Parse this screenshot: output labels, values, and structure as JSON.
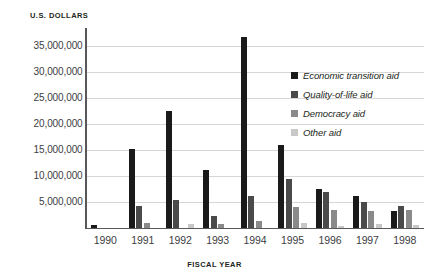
{
  "figure": {
    "title_remnant": "",
    "ylabel": "U.S. DOLLARS",
    "xlabel": "FISCAL YEAR"
  },
  "axis": {
    "yticks": [
      {
        "value": 35000000,
        "label": "35,000,000"
      },
      {
        "value": 30000000,
        "label": "30,000,000"
      },
      {
        "value": 25000000,
        "label": "25,000,000"
      },
      {
        "value": 20000000,
        "label": "20,000,000"
      },
      {
        "value": 15000000,
        "label": "15,000,000"
      },
      {
        "value": 10000000,
        "label": "10,000,000"
      },
      {
        "value": 5000000,
        "label": "5,000,000"
      }
    ]
  },
  "legend": {
    "items": [
      {
        "label": "Economic transition aid",
        "color": "#1a1a1a"
      },
      {
        "label": "Quality-of-life aid",
        "color": "#4a4a4a"
      },
      {
        "label": "Democracy aid",
        "color": "#8a8a8a"
      },
      {
        "label": "Other aid",
        "color": "#c8c8c8"
      }
    ]
  },
  "chart_data": {
    "type": "bar",
    "title": "",
    "xlabel": "FISCAL YEAR",
    "ylabel": "U.S. DOLLARS",
    "ylim": [
      0,
      38500000
    ],
    "grid": true,
    "legend_position": "right",
    "categories": [
      "1990",
      "1991",
      "1992",
      "1993",
      "1994",
      "1995",
      "1996",
      "1997",
      "1998"
    ],
    "series": [
      {
        "name": "Economic transition aid",
        "color": "#1a1a1a",
        "values": [
          500000,
          15300000,
          22500000,
          11200000,
          36800000,
          16000000,
          7500000,
          6200000,
          3300000
        ]
      },
      {
        "name": "Quality-of-life aid",
        "color": "#4a4a4a",
        "values": [
          0,
          4200000,
          5300000,
          2300000,
          6200000,
          9500000,
          7000000,
          5000000,
          4300000
        ]
      },
      {
        "name": "Democracy aid",
        "color": "#8a8a8a",
        "values": [
          0,
          1000000,
          0,
          700000,
          1300000,
          4000000,
          3500000,
          3300000,
          3500000
        ]
      },
      {
        "name": "Other aid",
        "color": "#c8c8c8",
        "values": [
          0,
          0,
          700000,
          0,
          0,
          1000000,
          400000,
          800000,
          500000
        ]
      }
    ]
  }
}
